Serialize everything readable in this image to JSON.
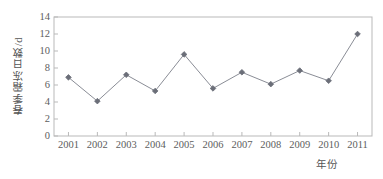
{
  "chart_data": {
    "type": "line",
    "title": "",
    "xlabel": "年份",
    "ylabel": "春季霜冻日数/d",
    "categories": [
      "2001",
      "2002",
      "2003",
      "2004",
      "2005",
      "2006",
      "2007",
      "2008",
      "2009",
      "2010",
      "2011"
    ],
    "x": [
      2001,
      2002,
      2003,
      2004,
      2005,
      2006,
      2007,
      2008,
      2009,
      2010,
      2011
    ],
    "values": [
      6.9,
      4.1,
      7.2,
      5.3,
      9.6,
      5.6,
      7.5,
      6.1,
      7.7,
      6.5,
      12.0
    ],
    "series": [
      {
        "name": "春季霜冻日数",
        "values": [
          6.9,
          4.1,
          7.2,
          5.3,
          9.6,
          5.6,
          7.5,
          6.1,
          7.7,
          6.5,
          12.0
        ]
      }
    ],
    "ylim": [
      0,
      14
    ],
    "yticks": [
      0,
      2,
      4,
      6,
      8,
      10,
      12,
      14
    ],
    "ytick_labels": [
      "0",
      "2",
      "4",
      "6",
      "8",
      "10",
      "12",
      "14"
    ],
    "xtick_labels": [
      "2001",
      "2002",
      "2003",
      "2004",
      "2005",
      "2006",
      "2007",
      "2008",
      "2009",
      "2010",
      "2011"
    ],
    "grid": false,
    "legend": "none",
    "marker": "diamond",
    "line_color": "#8a8d96",
    "marker_color": "#6b6e78",
    "axis_color": "#b9b9b9",
    "text_color": "#5a5a5a"
  }
}
